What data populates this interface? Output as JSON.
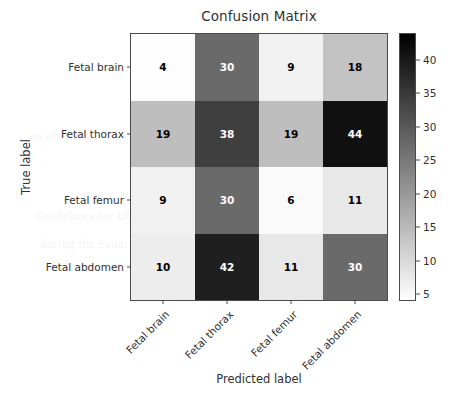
{
  "figure": {
    "title": "Confusion Matrix",
    "xlabel": "Predicted label",
    "ylabel": "True label"
  },
  "chart_data": {
    "type": "heatmap",
    "title": "Confusion Matrix",
    "xlabel": "Predicted label",
    "ylabel": "True label",
    "colormap": "gray_reversed",
    "x_categories": [
      "Fetal brain",
      "Fetal thorax",
      "Fetal femur",
      "Fetal abdomen"
    ],
    "y_categories": [
      "Fetal brain",
      "Fetal thorax",
      "Fetal femur",
      "Fetal abdomen"
    ],
    "values": [
      [
        4,
        30,
        9,
        18
      ],
      [
        19,
        38,
        19,
        44
      ],
      [
        9,
        30,
        6,
        11
      ],
      [
        10,
        42,
        11,
        30
      ]
    ],
    "vmin": 4,
    "vmax": 44,
    "colorbar": {
      "position": "right",
      "ticks": [
        5,
        10,
        15,
        20,
        25,
        30,
        35,
        40
      ],
      "tick_labels": [
        "5",
        "10",
        "15",
        "20",
        "25",
        "30",
        "35",
        "40"
      ],
      "orientation": "vertical",
      "low_color": "#ffffff",
      "high_color": "#000000"
    },
    "grid": false,
    "xtick_rotation": -45
  },
  "cells": [
    {
      "row": 0,
      "col": 0,
      "value": "4",
      "bg": "#fdfdfd",
      "fg": "#000000"
    },
    {
      "row": 0,
      "col": 1,
      "value": "30",
      "bg": "#6a6a6a",
      "fg": "#ffffff"
    },
    {
      "row": 0,
      "col": 2,
      "value": "9",
      "bg": "#f1f1f1",
      "fg": "#000000"
    },
    {
      "row": 0,
      "col": 3,
      "value": "18",
      "bg": "#c3c3c3",
      "fg": "#000000"
    },
    {
      "row": 1,
      "col": 0,
      "value": "19",
      "bg": "#bebebe",
      "fg": "#000000"
    },
    {
      "row": 1,
      "col": 1,
      "value": "38",
      "bg": "#3f3f3f",
      "fg": "#ffffff"
    },
    {
      "row": 1,
      "col": 2,
      "value": "19",
      "bg": "#bebebe",
      "fg": "#000000"
    },
    {
      "row": 1,
      "col": 3,
      "value": "44",
      "bg": "#111111",
      "fg": "#ffffff"
    },
    {
      "row": 2,
      "col": 0,
      "value": "9",
      "bg": "#f1f1f1",
      "fg": "#000000"
    },
    {
      "row": 2,
      "col": 1,
      "value": "30",
      "bg": "#6a6a6a",
      "fg": "#ffffff"
    },
    {
      "row": 2,
      "col": 2,
      "value": "6",
      "bg": "#fafafa",
      "fg": "#000000"
    },
    {
      "row": 2,
      "col": 3,
      "value": "11",
      "bg": "#e8e8e8",
      "fg": "#000000"
    },
    {
      "row": 3,
      "col": 0,
      "value": "10",
      "bg": "#ededed",
      "fg": "#000000"
    },
    {
      "row": 3,
      "col": 1,
      "value": "42",
      "bg": "#1f1f1f",
      "fg": "#ffffff"
    },
    {
      "row": 3,
      "col": 2,
      "value": "11",
      "bg": "#e8e8e8",
      "fg": "#000000"
    },
    {
      "row": 3,
      "col": 3,
      "value": "30",
      "bg": "#6a6a6a",
      "fg": "#ffffff"
    }
  ],
  "background_text": [
    "complete a discharge",
    "sound imaging",
    "an obstetric",
    "Guidelines for Obstetric",
    "during the exam",
    "Sonographic"
  ]
}
